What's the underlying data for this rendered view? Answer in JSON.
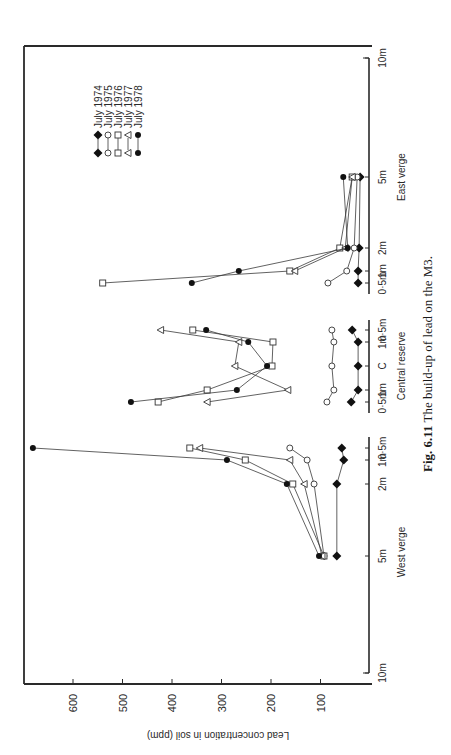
{
  "chart_data": {
    "type": "line",
    "title": "Fig. 6.11 The build-up of lead on the M3.",
    "caption_bold": "Fig. 6.11",
    "caption_text": "The build-up of lead on the M3.",
    "orientation": "rotated-90 (page printed sideways; value axis horizontal)",
    "ylabel": "Lead concentration in soil (ppm)",
    "ylim": [
      0,
      700
    ],
    "yticks": [
      100,
      200,
      300,
      400,
      500,
      600
    ],
    "xlabel_groups": [
      "West verge",
      "Central reserve",
      "East verge"
    ],
    "x_positions": {
      "west_verge": [
        "10m",
        "5m",
        "2m",
        "1m",
        "0·5m"
      ],
      "central_reserve": [
        "0·5m",
        "1m",
        "C",
        "1m",
        "0·5m"
      ],
      "east_verge": [
        "0·5m",
        "1m",
        "2m",
        "5m",
        "10m"
      ]
    },
    "categories": [
      "West 5m",
      "West 2m",
      "West 1m",
      "West 0·5m",
      "Central 0·5m (W)",
      "Central 1m (W)",
      "Central C",
      "Central 1m (E)",
      "Central 0·5m (E)",
      "East 0·5m",
      "East 1m",
      "East 2m",
      "East 5m"
    ],
    "series": [
      {
        "name": "July 1974",
        "marker": "diamond-filled",
        "values": [
          67,
          67,
          53,
          57,
          38,
          24,
          24,
          24,
          36,
          24,
          24,
          22,
          20
        ]
      },
      {
        "name": "July 1975",
        "marker": "circle-open",
        "values": [
          93,
          113,
          127,
          162,
          87,
          73,
          77,
          73,
          77,
          85,
          47,
          32,
          26
        ]
      },
      {
        "name": "July 1976",
        "marker": "square-open",
        "values": [
          93,
          156,
          252,
          364,
          428,
          329,
          198,
          196,
          358,
          540,
          162,
          61,
          36
        ]
      },
      {
        "name": "July 1977",
        "marker": "triangle-open",
        "values": [
          97,
          133,
          162,
          344,
          329,
          166,
          273,
          265,
          423,
          0,
          152,
          50,
          36
        ]
      },
      {
        "name": "July 1978",
        "marker": "circle-filled",
        "values": [
          103,
          168,
          289,
          681,
          483,
          269,
          208,
          246,
          331,
          360,
          265,
          45,
          54
        ]
      }
    ],
    "legend": [
      {
        "marker": "diamond-filled",
        "label": "July 1974"
      },
      {
        "marker": "circle-open",
        "label": "July 1975"
      },
      {
        "marker": "square-open",
        "label": "July 1976"
      },
      {
        "marker": "triangle-open",
        "label": "July 1977"
      },
      {
        "marker": "circle-filled",
        "label": "July 1978"
      }
    ],
    "legend_position": "upper-left (in rotated frame)",
    "grid": false
  },
  "axis_labels": {
    "y_title": "Lead concentration in soil (ppm)",
    "y_ticks": [
      "600",
      "500",
      "400",
      "300",
      "200",
      "100"
    ],
    "west": {
      "group": "West verge",
      "ticks": [
        "10m",
        "5m",
        "2m",
        "1m",
        "0·5m"
      ]
    },
    "central": {
      "group": "Central reserve",
      "ticks": [
        "0·5m",
        "1m",
        "C",
        "1m",
        "0·5m"
      ]
    },
    "east": {
      "group": "East verge",
      "ticks": [
        "0·5m",
        "1m",
        "2m",
        "5m",
        "10m"
      ]
    }
  },
  "legend": {
    "items": [
      {
        "label": "July 1974"
      },
      {
        "label": "July 1975"
      },
      {
        "label": "July 1976"
      },
      {
        "label": "July 1977"
      },
      {
        "label": "July 1978"
      }
    ]
  },
  "caption": {
    "bold": "Fig. 6.11",
    "text": " The build-up of lead on the M3."
  }
}
